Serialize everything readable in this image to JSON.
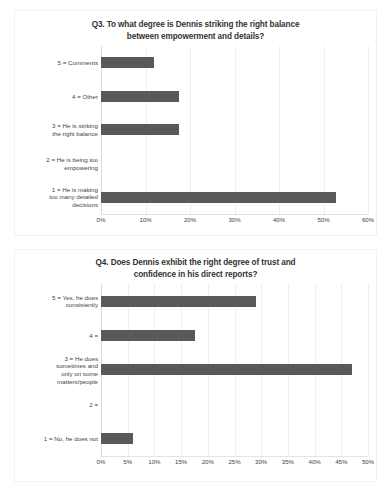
{
  "chart_data": [
    {
      "id": "q3",
      "type": "bar",
      "orientation": "horizontal",
      "title": "Q3. To what degree is Dennis striking the right balance between empowerment and details?",
      "title_line_1": "Q3. To what degree is Dennis striking the right balance",
      "title_line_2": "between empowerment and details?",
      "xlabel": "",
      "ylabel": "",
      "xlim": [
        0,
        60
      ],
      "xtick_step": 10,
      "xticks": [
        "0%",
        "10%",
        "20%",
        "30%",
        "40%",
        "50%",
        "60%"
      ],
      "xtick_values": [
        0,
        10,
        20,
        30,
        40,
        50,
        60
      ],
      "grid": true,
      "legend": "none",
      "bar_color": "#595959",
      "categories": [
        "5 = Comments",
        "4 = Other",
        "3 = He is striking the right balance",
        "2 = He is being too empowering",
        "1 = He is making too many detailed decisions"
      ],
      "values": [
        11.8,
        17.6,
        17.6,
        0,
        52.9
      ],
      "bars": [
        {
          "label": "5 = Comments",
          "label_lines": [
            "5 = Comments"
          ],
          "value": 11.8
        },
        {
          "label": "4 = Other",
          "label_lines": [
            "4 = Other"
          ],
          "value": 17.6
        },
        {
          "label": "3 = He is striking the right balance",
          "label_lines": [
            "3 = He is striking",
            "the right balance"
          ],
          "value": 17.6
        },
        {
          "label": "2 = He is being too empowering",
          "label_lines": [
            "2 = He is being too",
            "empowering"
          ],
          "value": 0
        },
        {
          "label": "1 = He is making too many detailed decisions",
          "label_lines": [
            "1 = He is making",
            "too many detailed",
            "decisions"
          ],
          "value": 52.9
        }
      ]
    },
    {
      "id": "q4",
      "type": "bar",
      "orientation": "horizontal",
      "title": "Q4. Does Dennis exhibit the right degree of trust and confidence in his direct reports?",
      "title_line_1": "Q4. Does Dennis exhibit the right degree of trust and",
      "title_line_2": "confidence in his direct reports?",
      "xlabel": "",
      "ylabel": "",
      "xlim": [
        0,
        50
      ],
      "xtick_step": 5,
      "xticks": [
        "0%",
        "5%",
        "10%",
        "15%",
        "20%",
        "25%",
        "30%",
        "35%",
        "40%",
        "45%",
        "50%"
      ],
      "xtick_values": [
        0,
        5,
        10,
        15,
        20,
        25,
        30,
        35,
        40,
        45,
        50
      ],
      "grid": true,
      "legend": "none",
      "bar_color": "#595959",
      "categories": [
        "5 = Yes, he does consistently",
        "4 =",
        "3 = He does sometimes and only on some matters/people",
        "2 =",
        "1 = No, he does not"
      ],
      "values": [
        29.0,
        17.6,
        47.0,
        0,
        5.9
      ],
      "bars": [
        {
          "label": "5 = Yes, he does consistently",
          "label_lines": [
            "5 = Yes, he does",
            "consistently"
          ],
          "value": 29.0
        },
        {
          "label": "4 =",
          "label_lines": [
            "4 ="
          ],
          "value": 17.6
        },
        {
          "label": "3 = He does sometimes and only on some matters/people",
          "label_lines": [
            "3 = He does",
            "sometimes and",
            "only on some",
            "matters/people"
          ],
          "value": 47.0
        },
        {
          "label": "2 =",
          "label_lines": [
            "2 ="
          ],
          "value": 0
        },
        {
          "label": "1 = No, he does not",
          "label_lines": [
            "1 = No, he does not"
          ],
          "value": 5.9
        }
      ]
    }
  ]
}
